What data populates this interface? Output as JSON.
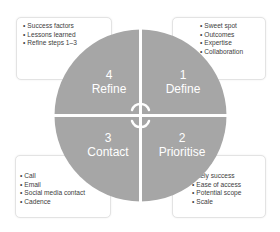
{
  "colors": {
    "wheel_fill": "#a6a6a6",
    "wheel_text": "#ffffff",
    "box_border": "#e3e3e3",
    "box_text": "#404040",
    "separator": "#ffffff"
  },
  "quadrants": [
    {
      "position": "top-right",
      "number": "1",
      "title": "Define"
    },
    {
      "position": "bottom-right",
      "number": "2",
      "title": "Prioritise"
    },
    {
      "position": "bottom-left",
      "number": "3",
      "title": "Contact"
    },
    {
      "position": "top-left",
      "number": "4",
      "title": "Refine"
    }
  ],
  "boxes": {
    "define": {
      "items": [
        "Sweet spot",
        "Outcomes",
        "Expertise",
        "Collaboration"
      ]
    },
    "prioritise": {
      "items": [
        "Likely success",
        "Ease of access",
        "Potential scope",
        "Scale"
      ]
    },
    "contact": {
      "items": [
        "Call",
        "Email",
        "Social media contact",
        "Cadence"
      ]
    },
    "refine": {
      "items": [
        "Success factors",
        "Lessons learned",
        "Refine steps 1–3"
      ]
    }
  },
  "center_icon": "circular-arrows-icon"
}
